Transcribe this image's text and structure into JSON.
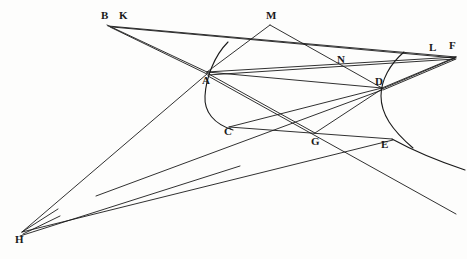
{
  "figure": {
    "background_color": "#fdfdfc",
    "ink_color": "#1a1a1a",
    "width": 467,
    "height": 259,
    "labels": {
      "B": "B",
      "K": "K",
      "M": "M",
      "N": "N",
      "L": "L",
      "F": "F",
      "A": "A",
      "D": "D",
      "C": "C",
      "G": "G",
      "E": "E",
      "H": "H"
    },
    "points": [
      {
        "id": "B",
        "label": "B",
        "x": 107,
        "y": 25,
        "label_x": 101,
        "label_y": 19
      },
      {
        "id": "K",
        "label": "K",
        "x": 117,
        "y": 26,
        "label_x": 119,
        "label_y": 19
      },
      {
        "id": "M",
        "label": "M",
        "x": 270,
        "y": 25,
        "label_x": 266,
        "label_y": 19
      },
      {
        "id": "N",
        "label": "N",
        "x": 340,
        "y": 57,
        "label_x": 337,
        "label_y": 63
      },
      {
        "id": "L",
        "label": "L",
        "x": 437,
        "y": 54,
        "label_x": 429,
        "label_y": 51
      },
      {
        "id": "F",
        "label": "F",
        "x": 456,
        "y": 57,
        "label_x": 449,
        "label_y": 49
      },
      {
        "id": "A",
        "label": "A",
        "x": 207,
        "y": 72,
        "label_x": 202,
        "label_y": 84
      },
      {
        "id": "D",
        "label": "D",
        "x": 382,
        "y": 88,
        "label_x": 375,
        "label_y": 85
      },
      {
        "id": "C",
        "label": "C",
        "x": 229,
        "y": 127,
        "label_x": 224,
        "label_y": 135
      },
      {
        "id": "G",
        "label": "G",
        "x": 315,
        "y": 133,
        "label_x": 311,
        "label_y": 145
      },
      {
        "id": "E",
        "label": "E",
        "x": 385,
        "y": 137,
        "label_x": 381,
        "label_y": 148
      },
      {
        "id": "H",
        "label": "H",
        "x": 22,
        "y": 232,
        "label_x": 15,
        "label_y": 243
      }
    ],
    "segments": [
      {
        "name": "B-to-A-upper",
        "from": "B",
        "to": "A",
        "x1": 107,
        "y1": 25,
        "x2": 207,
        "y2": 72
      },
      {
        "name": "K-to-A",
        "from": "K",
        "to": "A",
        "x1": 110,
        "y1": 27,
        "x2": 207,
        "y2": 74
      },
      {
        "name": "B-to-F-long",
        "from": "B",
        "to": "F",
        "x1": 108,
        "y1": 26,
        "x2": 456,
        "y2": 57
      },
      {
        "name": "K-to-F-long",
        "from": "K",
        "to": "F",
        "x1": 112,
        "y1": 27,
        "x2": 455,
        "y2": 58
      },
      {
        "name": "M-to-A",
        "from": "M",
        "to": "A",
        "x1": 270,
        "y1": 25,
        "x2": 207,
        "y2": 72
      },
      {
        "name": "M-to-D-through-N",
        "from": "M",
        "to": "D",
        "x1": 270,
        "y1": 25,
        "x2": 382,
        "y2": 88
      },
      {
        "name": "A-to-D",
        "from": "A",
        "to": "D",
        "x1": 207,
        "y1": 72,
        "x2": 382,
        "y2": 88
      },
      {
        "name": "A-to-F",
        "from": "A",
        "to": "F",
        "x1": 207,
        "y1": 72,
        "x2": 456,
        "y2": 57
      },
      {
        "name": "A-to-L",
        "from": "A",
        "to": "L",
        "x1": 208,
        "y1": 75,
        "x2": 455,
        "y2": 59
      },
      {
        "name": "A-to-G",
        "from": "A",
        "to": "G",
        "x1": 207,
        "y1": 73,
        "x2": 315,
        "y2": 133
      },
      {
        "name": "A-to-F-lower-through-G",
        "from": "A",
        "to": "F",
        "x1": 208,
        "y1": 76,
        "x2": 456,
        "y2": 214
      },
      {
        "name": "D-to-C",
        "from": "D",
        "to": "C",
        "x1": 382,
        "y1": 88,
        "x2": 229,
        "y2": 127
      },
      {
        "name": "D-to-G",
        "from": "D",
        "to": "G",
        "x1": 382,
        "y1": 89,
        "x2": 315,
        "y2": 133
      },
      {
        "name": "D-to-H-long",
        "from": "D",
        "to": "H",
        "x1": 382,
        "y1": 90,
        "x2": 96,
        "y2": 196
      },
      {
        "name": "D-to-F",
        "from": "D",
        "to": "F",
        "x1": 382,
        "y1": 88,
        "x2": 456,
        "y2": 57
      },
      {
        "name": "D-to-L",
        "from": "D",
        "to": "L",
        "x1": 382,
        "y1": 89,
        "x2": 455,
        "y2": 58
      },
      {
        "name": "D-to-F-lower",
        "from": "D",
        "to": "F",
        "x1": 383,
        "y1": 90,
        "x2": 456,
        "y2": 59
      },
      {
        "name": "C-to-E",
        "from": "C",
        "to": "E",
        "x1": 229,
        "y1": 127,
        "x2": 392,
        "y2": 139
      },
      {
        "name": "H-to-A-ray",
        "from": "H",
        "to": "A",
        "x1": 22,
        "y1": 232,
        "x2": 207,
        "y2": 74
      },
      {
        "name": "H-to-E-ray",
        "from": "H",
        "to": "E",
        "x1": 22,
        "y1": 232,
        "x2": 393,
        "y2": 140
      },
      {
        "name": "H-stub-upper",
        "from": "H",
        "to": "stub1",
        "x1": 22,
        "y1": 232,
        "x2": 58,
        "y2": 209
      },
      {
        "name": "H-stub-lower",
        "from": "H",
        "to": "stub2",
        "x1": 23,
        "y1": 234,
        "x2": 60,
        "y2": 216
      },
      {
        "name": "H-baseline-ray",
        "from": "H",
        "to": "baseline",
        "x1": 20,
        "y1": 236,
        "x2": 240,
        "y2": 166
      }
    ],
    "curves": [
      {
        "name": "left-conic-branch",
        "description": "curve through A opening downward-left toward C",
        "path": "M 228 42 C 214 56 206 78 205 96 C 204 112 214 124 233 130"
      },
      {
        "name": "right-conic-branch",
        "description": "curve through D opening right past E",
        "path": "M 404 52 C 390 64 381 80 381 96 C 381 114 392 130 413 148"
      },
      {
        "name": "right-tail",
        "description": "tail continuing from E down to the right edge",
        "path": "M 392 139 C 412 150 435 160 465 170"
      }
    ]
  }
}
